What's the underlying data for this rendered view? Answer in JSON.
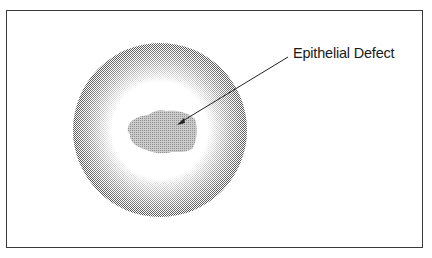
{
  "figure": {
    "label": "Epithelial Defect",
    "colors": {
      "frame": "#3a3a3a",
      "cornea_ring": "#9a9a9a",
      "cornea_center": "#ffffff",
      "defect": "#a8a8a8",
      "pointer": "#222222",
      "text": "#1a1a1a"
    }
  },
  "caption": {
    "text": ""
  }
}
